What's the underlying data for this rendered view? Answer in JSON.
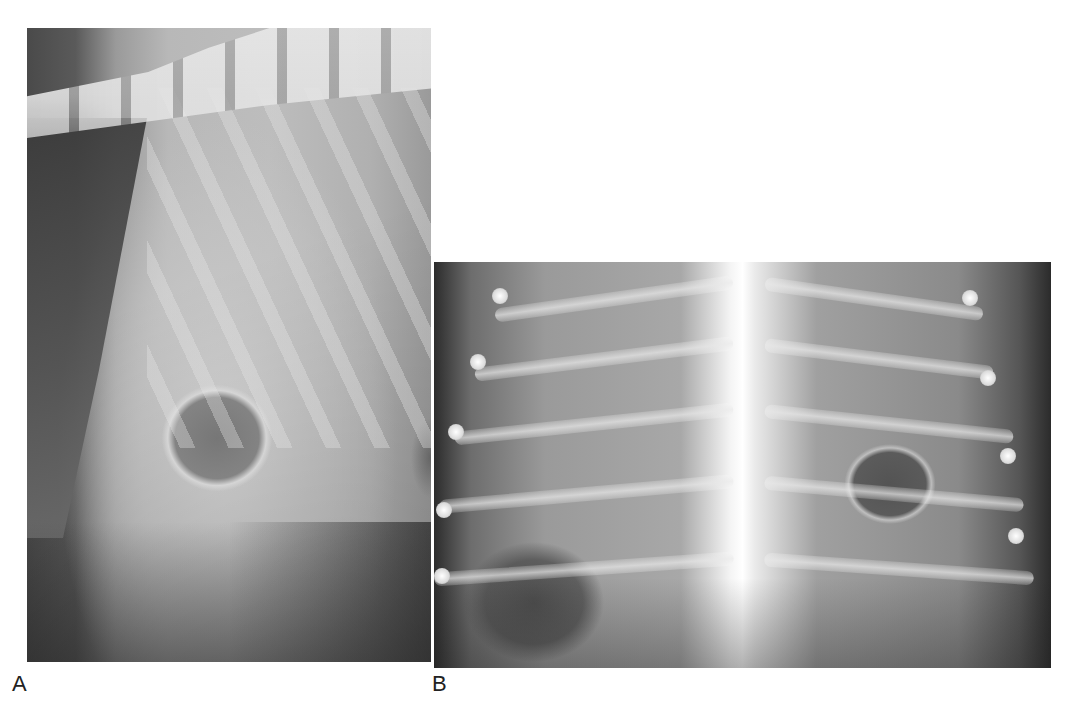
{
  "figure": {
    "panels": [
      {
        "id": "A",
        "label": "A",
        "description": "Lateral thoracic radiograph"
      },
      {
        "id": "B",
        "label": "B",
        "description": "Ventrodorsal thoracic radiograph"
      }
    ]
  }
}
